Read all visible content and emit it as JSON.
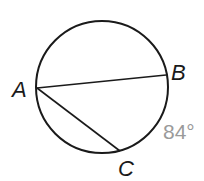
{
  "diagram": {
    "type": "circle-geometry",
    "circle": {
      "cx": 102,
      "cy": 87,
      "r": 66,
      "stroke": "#1a1a1a"
    },
    "points": [
      {
        "name": "A",
        "x": 37,
        "y": 88,
        "label": "A",
        "label_x": 12,
        "label_y": 97
      },
      {
        "name": "B",
        "x": 166,
        "y": 75,
        "label": "B",
        "label_x": 171,
        "label_y": 80
      },
      {
        "name": "C",
        "x": 120,
        "y": 151,
        "label": "C",
        "label_x": 118,
        "label_y": 176
      }
    ],
    "chords": [
      {
        "from": "A",
        "to": "B"
      },
      {
        "from": "A",
        "to": "C"
      }
    ],
    "arc_measure": {
      "text": "84°",
      "arc": "BC",
      "x": 163,
      "y": 139,
      "color": "#9a9a9a"
    }
  }
}
